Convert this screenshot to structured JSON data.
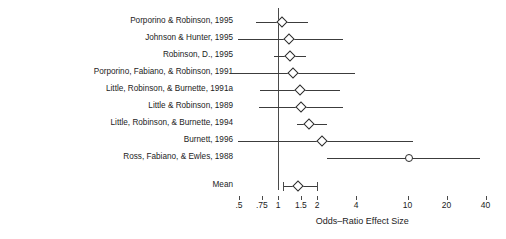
{
  "figure": {
    "axis_title": "Odds–Ratio Effect Size",
    "mean_label": "Mean",
    "line_color": "#3c3c3c",
    "marker_color": "#2b2b2b",
    "reference_color": "#4a4a4a"
  },
  "chart_data": {
    "type": "forest",
    "title": "",
    "xlabel": "Odds–Ratio Effect Size",
    "ylabel": "",
    "scale": "log",
    "reference_value": 1,
    "xlim": [
      0.42,
      48
    ],
    "grid": false,
    "legend": "none",
    "tick_values": [
      0.5,
      0.75,
      1,
      1.5,
      2,
      4,
      10,
      20,
      40
    ],
    "tick_labels": [
      ".5",
      ".75",
      "1",
      "1.5",
      "2",
      "4",
      "10",
      "20",
      "40"
    ],
    "studies": [
      {
        "label": "Porporino & Robinson, 1995",
        "estimate": 1.07,
        "ci_low": 0.68,
        "ci_high": 1.71,
        "marker": "diamond"
      },
      {
        "label": "Johnson & Hunter, 1995",
        "estimate": 1.21,
        "ci_low": 0.49,
        "ci_high": 3.2,
        "marker": "diamond"
      },
      {
        "label": "Robinson, D., 1995",
        "estimate": 1.24,
        "ci_low": 0.93,
        "ci_high": 1.65,
        "marker": "diamond"
      },
      {
        "label": "Porporino, Fabiano, & Robinson, 1991",
        "estimate": 1.3,
        "ci_low": 0.44,
        "ci_high": 3.9,
        "marker": "diamond"
      },
      {
        "label": "Little, Robinson, & Burnette, 1991a",
        "estimate": 1.47,
        "ci_low": 0.72,
        "ci_high": 3.0,
        "marker": "diamond"
      },
      {
        "label": "Little & Robinson, 1989",
        "estimate": 1.5,
        "ci_low": 0.71,
        "ci_high": 3.2,
        "marker": "diamond"
      },
      {
        "label": "Little, Robinson, & Burnette, 1994",
        "estimate": 1.73,
        "ci_low": 1.4,
        "ci_high": 2.4,
        "marker": "diamond"
      },
      {
        "label": "Burnett, 1996",
        "estimate": 2.2,
        "ci_low": 0.49,
        "ci_high": 11.0,
        "marker": "diamond"
      },
      {
        "label": "Ross, Fabiano, & Ewles, 1988",
        "estimate": 10.2,
        "ci_low": 2.4,
        "ci_high": 36.0,
        "marker": "circle"
      }
    ],
    "mean": {
      "label": "Mean",
      "estimate": 1.43,
      "ci_low": 1.09,
      "ci_high": 2.0,
      "marker": "diamond"
    }
  }
}
